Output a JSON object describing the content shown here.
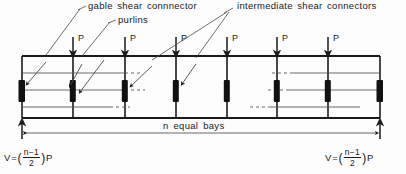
{
  "figure": {
    "type": "structural-engineering-diagram",
    "ink_color": "#1a1a1a",
    "background_color": "#fdfdfd"
  },
  "annotations": {
    "gable": "gable  shear  connnector",
    "purlins": "purlins",
    "intermediate": "intermediate  shear  connectors"
  },
  "loads": {
    "label": "P",
    "count": 6,
    "positions_px": [
      73,
      125,
      176,
      227,
      277,
      328
    ]
  },
  "frame": {
    "left_px": 22,
    "right_px": 380,
    "top_px": 56,
    "bottom_px": 118,
    "vertical_positions_px": [
      22,
      73,
      125,
      176,
      227,
      277,
      328,
      380
    ],
    "bay_count": 7,
    "purlin_rows_px": [
      73,
      90,
      107
    ],
    "connector_top_px": 80,
    "connector_bottom_px": 102
  },
  "dimension": {
    "text": "n  equal   bays"
  },
  "reactions": {
    "left": {
      "v": "V",
      "equals": "=",
      "open_paren": "(",
      "numerator": "n−1",
      "denominator": "2",
      "close_paren": ")",
      "load": "P"
    },
    "right": {
      "v": "V",
      "equals": "=",
      "open_paren": "(",
      "numerator": "n−1",
      "denominator": "2",
      "close_paren": ")",
      "load": "P"
    }
  }
}
